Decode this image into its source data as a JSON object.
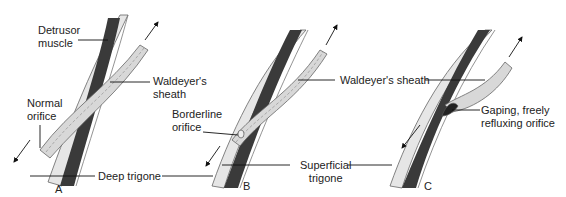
{
  "figure": {
    "panels": [
      {
        "id": "A",
        "letter": "A",
        "labels": {
          "detrusor_line1": "Detrusor",
          "detrusor_line2": "muscle",
          "normal_line1": "Normal",
          "normal_line2": "orifice",
          "waldeyer_line1": "Waldeyer's",
          "waldeyer_line2": "sheath"
        }
      },
      {
        "id": "B",
        "letter": "B",
        "labels": {
          "borderline_line1": "Borderline",
          "borderline_line2": "orifice",
          "waldeyer": "Waldeyer's sheath"
        }
      },
      {
        "id": "C",
        "letter": "C",
        "labels": {
          "gaping_line1": "Gaping, freely",
          "gaping_line2": "refluxing orifice"
        }
      }
    ],
    "shared_labels": {
      "deep_trigone": "Deep trigone",
      "superficial_line1": "Superficial",
      "superficial_line2": "trigone"
    },
    "colors": {
      "muscle": "#3a3a3a",
      "sheath": "#d8d8d8",
      "outline": "#555555",
      "leader": "#111111"
    }
  }
}
